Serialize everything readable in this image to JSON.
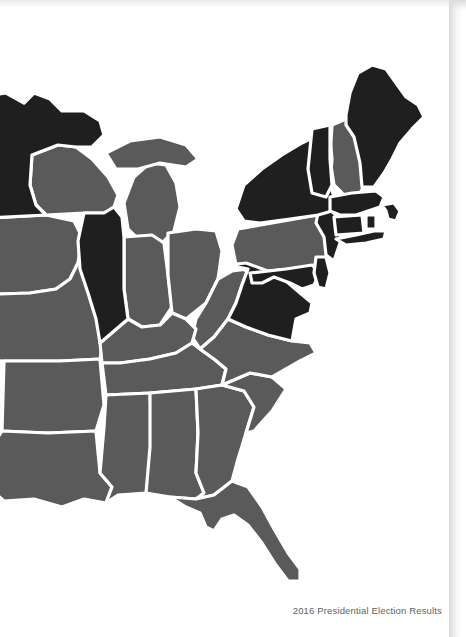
{
  "document": {
    "figure_caption": "2016 Presidential Election Results"
  },
  "map": {
    "name": "eastern-united-states-choropleth",
    "region_label": "Eastern United States",
    "colors": {
      "democratic_fill": "#1f1f1f",
      "republican_fill": "#5a5a5a",
      "state_border": "#ffffff",
      "page_background": "#ffffff",
      "caption_text": "#5d5f62",
      "page_shadow": "#bcbcc0"
    },
    "legend": {
      "dark_meaning": "Democratic",
      "gray_meaning": "Republican"
    },
    "states": [
      {
        "code": "MN",
        "name": "Minnesota",
        "result": "democratic"
      },
      {
        "code": "IA",
        "name": "Iowa",
        "result": "republican"
      },
      {
        "code": "MO",
        "name": "Missouri",
        "result": "republican"
      },
      {
        "code": "AR",
        "name": "Arkansas",
        "result": "republican"
      },
      {
        "code": "LA",
        "name": "Louisiana",
        "result": "republican"
      },
      {
        "code": "WI",
        "name": "Wisconsin",
        "result": "republican"
      },
      {
        "code": "IL",
        "name": "Illinois",
        "result": "democratic"
      },
      {
        "code": "MI",
        "name": "Michigan",
        "result": "republican"
      },
      {
        "code": "IN",
        "name": "Indiana",
        "result": "republican"
      },
      {
        "code": "OH",
        "name": "Ohio",
        "result": "republican"
      },
      {
        "code": "KY",
        "name": "Kentucky",
        "result": "republican"
      },
      {
        "code": "TN",
        "name": "Tennessee",
        "result": "republican"
      },
      {
        "code": "MS",
        "name": "Mississippi",
        "result": "republican"
      },
      {
        "code": "AL",
        "name": "Alabama",
        "result": "republican"
      },
      {
        "code": "GA",
        "name": "Georgia",
        "result": "republican"
      },
      {
        "code": "FL",
        "name": "Florida",
        "result": "republican"
      },
      {
        "code": "SC",
        "name": "South Carolina",
        "result": "republican"
      },
      {
        "code": "NC",
        "name": "North Carolina",
        "result": "republican"
      },
      {
        "code": "WV",
        "name": "West Virginia",
        "result": "republican"
      },
      {
        "code": "VA",
        "name": "Virginia",
        "result": "democratic"
      },
      {
        "code": "MD",
        "name": "Maryland",
        "result": "democratic"
      },
      {
        "code": "DE",
        "name": "Delaware",
        "result": "democratic"
      },
      {
        "code": "PA",
        "name": "Pennsylvania",
        "result": "republican"
      },
      {
        "code": "NJ",
        "name": "New Jersey",
        "result": "democratic"
      },
      {
        "code": "NY",
        "name": "New York",
        "result": "democratic"
      },
      {
        "code": "CT",
        "name": "Connecticut",
        "result": "democratic"
      },
      {
        "code": "RI",
        "name": "Rhode Island",
        "result": "democratic"
      },
      {
        "code": "MA",
        "name": "Massachusetts",
        "result": "democratic"
      },
      {
        "code": "VT",
        "name": "Vermont",
        "result": "democratic"
      },
      {
        "code": "NH",
        "name": "New Hampshire",
        "result": "republican"
      },
      {
        "code": "ME",
        "name": "Maine",
        "result": "democratic"
      }
    ]
  }
}
